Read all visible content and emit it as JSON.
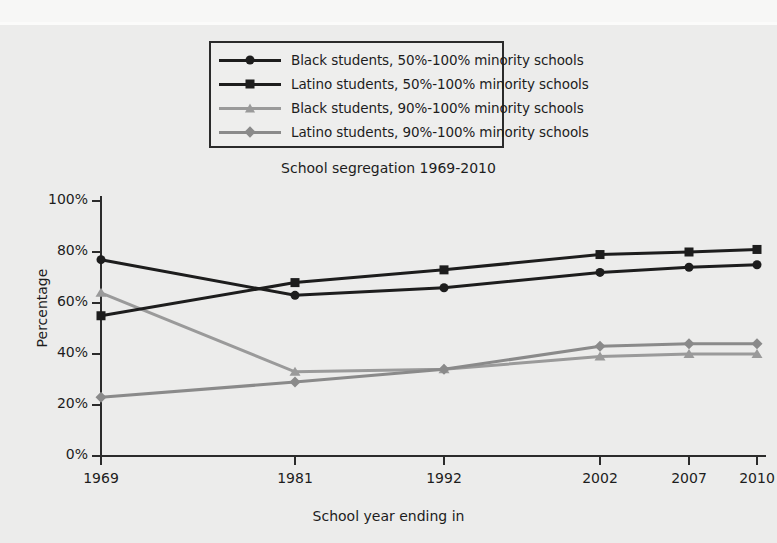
{
  "chart_data": {
    "type": "line",
    "title": "School segregation 1969-2010",
    "xlabel": "School year ending in",
    "ylabel": "Percentage",
    "categories": [
      "1969",
      "1981",
      "1992",
      "2002",
      "2007",
      "2010"
    ],
    "ylim": [
      0,
      100
    ],
    "ytick_labels": [
      "0%",
      "20%",
      "40%",
      "60%",
      "80%",
      "100%"
    ],
    "ytick_values": [
      0,
      20,
      40,
      60,
      80,
      100
    ],
    "grid": false,
    "legend_position": "above-plot",
    "series": [
      {
        "name": "Black students, 50%-100% minority schools",
        "marker": "circle",
        "color": "#1d1d1d",
        "values": [
          77,
          63,
          66,
          72,
          74,
          75
        ]
      },
      {
        "name": "Latino students, 50%-100% minority schools",
        "marker": "square",
        "color": "#1d1d1d",
        "values": [
          55,
          68,
          73,
          79,
          80,
          81
        ]
      },
      {
        "name": "Black students, 90%-100% minority schools",
        "marker": "triangle",
        "color": "#9a9a9a",
        "values": [
          64,
          33,
          34,
          39,
          40,
          40
        ]
      },
      {
        "name": "Latino students, 90%-100% minority schools",
        "marker": "diamond",
        "color": "#8a8a8a",
        "values": [
          23,
          29,
          34,
          43,
          44,
          44
        ]
      }
    ]
  },
  "colors": {
    "background": "#ececeb",
    "axis": "#2b2b2b",
    "dark_series": "#1d1d1d",
    "light_series": "#9a9a9a",
    "legend_border": "#2b2b2b"
  }
}
